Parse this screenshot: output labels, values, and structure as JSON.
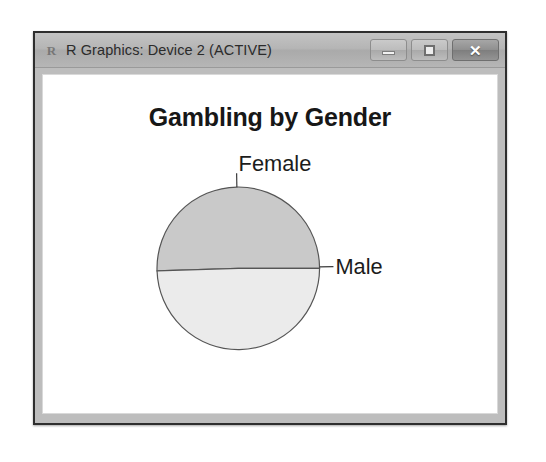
{
  "window": {
    "title": "R Graphics: Device 2 (ACTIVE)",
    "app_icon": "R",
    "buttons": {
      "minimize": "minimize",
      "maximize": "maximize",
      "close": "✕"
    }
  },
  "chart_data": {
    "type": "pie",
    "title": "Gambling by Gender",
    "categories": [
      "Female",
      "Male"
    ],
    "values": [
      50.5,
      49.5
    ],
    "labels": [
      "Female",
      "Male"
    ],
    "colors": [
      "#c9c9c9",
      "#ebebeb"
    ],
    "border_color": "#555555",
    "legend": "none",
    "grid": false,
    "xlabel": "",
    "ylabel": "",
    "start_angle": 0,
    "label_positions": [
      {
        "label": "Female",
        "angle_deg": 91,
        "anchor": "start"
      },
      {
        "label": "Male",
        "angle_deg": 1,
        "anchor": "start"
      }
    ]
  }
}
